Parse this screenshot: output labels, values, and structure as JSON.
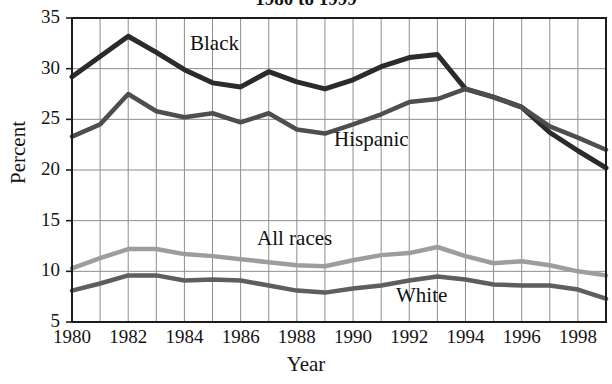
{
  "chart_data": {
    "type": "line",
    "title": "1980 to 1999",
    "xlabel": "Year",
    "ylabel": "Percent",
    "xlim": [
      1980,
      1999
    ],
    "ylim": [
      5,
      35
    ],
    "ytick_labels": [
      "35",
      "30",
      "25",
      "20",
      "15",
      "10",
      "5"
    ],
    "yticks": [
      35,
      30,
      25,
      20,
      15,
      10,
      5
    ],
    "xtick_labels": [
      "1980",
      "1982",
      "1984",
      "1986",
      "1988",
      "1990",
      "1992",
      "1994",
      "1996",
      "1998"
    ],
    "xticks": [
      1980,
      1982,
      1984,
      1986,
      1988,
      1990,
      1992,
      1994,
      1996,
      1998
    ],
    "grid": true,
    "legend_position": "inline-annotations",
    "x": [
      1980,
      1981,
      1982,
      1983,
      1984,
      1985,
      1986,
      1987,
      1988,
      1989,
      1990,
      1991,
      1992,
      1993,
      1994,
      1995,
      1996,
      1997,
      1998,
      1999
    ],
    "series": [
      {
        "name": "Black",
        "color": "#2b2b2b",
        "width": 5.0,
        "values": [
          29.2,
          31.2,
          33.2,
          31.6,
          29.9,
          28.6,
          28.2,
          29.7,
          28.7,
          28.0,
          28.9,
          30.2,
          31.1,
          31.4,
          28.0,
          27.2,
          26.2,
          23.7,
          21.9,
          20.2
        ]
      },
      {
        "name": "Hispanic",
        "color": "#4e4e4e",
        "width": 4.5,
        "values": [
          23.3,
          24.5,
          27.5,
          25.8,
          25.2,
          25.6,
          24.7,
          25.6,
          24.0,
          23.6,
          24.5,
          25.5,
          26.7,
          27.0,
          28.0,
          27.2,
          26.2,
          24.3,
          23.2,
          22.0
        ]
      },
      {
        "name": "All races",
        "color": "#9d9d9d",
        "width": 4.5,
        "values": [
          10.3,
          11.3,
          12.2,
          12.2,
          11.7,
          11.5,
          11.2,
          10.9,
          10.6,
          10.5,
          11.1,
          11.6,
          11.8,
          12.4,
          11.5,
          10.8,
          11.0,
          10.6,
          10.0,
          9.6
        ]
      },
      {
        "name": "White",
        "color": "#5e5e5e",
        "width": 4.5,
        "values": [
          8.1,
          8.8,
          9.6,
          9.6,
          9.1,
          9.2,
          9.1,
          8.6,
          8.1,
          7.9,
          8.3,
          8.6,
          9.1,
          9.5,
          9.2,
          8.7,
          8.6,
          8.6,
          8.2,
          7.3
        ]
      }
    ],
    "annotations": [
      {
        "text": "Black",
        "x_px": 190,
        "y_px": 31
      },
      {
        "text": "Hispanic",
        "x_px": 334,
        "y_px": 127
      },
      {
        "text": "All races",
        "x_px": 257,
        "y_px": 226
      },
      {
        "text": "White",
        "x_px": 396,
        "y_px": 283
      }
    ]
  }
}
